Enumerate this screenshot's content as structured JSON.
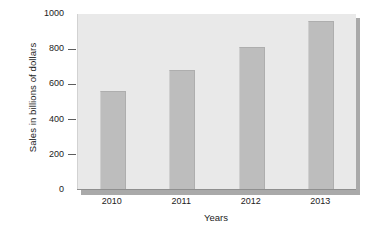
{
  "chart_data": {
    "type": "bar",
    "title": "",
    "categories": [
      "2010",
      "2011",
      "2012",
      "2013"
    ],
    "values": [
      565,
      680,
      815,
      960
    ],
    "series": [
      {
        "name": "Sales",
        "values": [
          565,
          680,
          815,
          960
        ]
      }
    ],
    "xlabel": "Years",
    "ylabel": "Sales in billions of dollars",
    "ylim": [
      0,
      1000
    ],
    "xlim_categories": 4,
    "yticks": [
      0,
      200,
      400,
      600,
      800,
      1000
    ],
    "ytick_labels": [
      "0",
      "200",
      "400",
      "600",
      "800",
      "1000"
    ],
    "grid": false,
    "legend": false,
    "legend_position": "none",
    "annotations": [],
    "colors": {
      "bar_fill": "#bdbdbd",
      "plot_background": "#e9e9e9",
      "bevel_shadow": "#a9a9a9",
      "axis_line": "#8f8f8f",
      "text": "#1c1c1c",
      "page_background": "#ffffff"
    }
  }
}
